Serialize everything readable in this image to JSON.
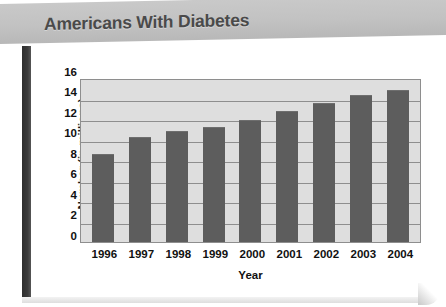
{
  "banner": {
    "title": "Americans With Diabetes"
  },
  "colors": {
    "banner_bg": "#c2c2c2",
    "title_text": "#4a4a4a",
    "plot_bg": "#dedede",
    "bar_fill": "#5d5d5d",
    "gridline": "#8e8e8e",
    "axis_text": "#111111",
    "card_spine": "#2e2e2e"
  },
  "chart_data": {
    "type": "bar",
    "title": "Americans With Diabetes",
    "xlabel": "Year",
    "ylabel": "Number (in millions)",
    "categories": [
      "1996",
      "1997",
      "1998",
      "1999",
      "2000",
      "2001",
      "2002",
      "2003",
      "2004"
    ],
    "values": [
      8.6,
      10.2,
      10.8,
      11.2,
      11.9,
      12.8,
      13.6,
      14.3,
      14.8
    ],
    "ylim": [
      0,
      16
    ],
    "yticks": [
      16,
      14,
      12,
      10,
      8,
      6,
      4,
      2,
      0
    ],
    "grid": true,
    "legend": "none",
    "series": [
      {
        "name": "Number (in millions)",
        "values": [
          8.6,
          10.2,
          10.8,
          11.2,
          11.9,
          12.8,
          13.6,
          14.3,
          14.8
        ]
      }
    ]
  }
}
